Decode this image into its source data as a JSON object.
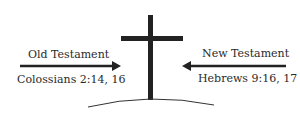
{
  "diagram": {
    "left": {
      "title": "Old Testament",
      "reference": "Colossians 2:14, 16",
      "arrow_direction": "right"
    },
    "right": {
      "title": "New Testament",
      "reference": "Hebrews 9:16, 17",
      "arrow_direction": "left"
    },
    "center_symbol": "cross-icon",
    "ground": "hill-arc",
    "colors": {
      "ink": "#222222",
      "background": "#ffffff"
    }
  }
}
